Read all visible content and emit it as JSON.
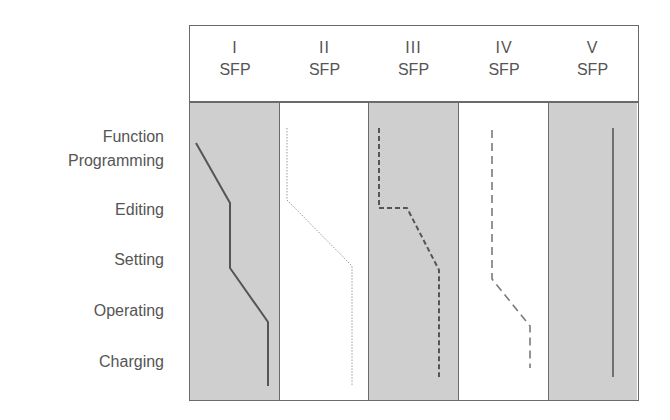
{
  "diagram": {
    "type": "phase-diagram",
    "row_header_label": "Function",
    "rows": [
      {
        "label": "Programming",
        "y": 161
      },
      {
        "label": "Editing",
        "y": 210
      },
      {
        "label": "Setting",
        "y": 260
      },
      {
        "label": "Operating",
        "y": 311
      },
      {
        "label": "Charging",
        "y": 362
      }
    ],
    "columns": [
      {
        "roman": "I",
        "sub": "SFP",
        "shaded": true
      },
      {
        "roman": "II",
        "sub": "SFP",
        "shaded": false
      },
      {
        "roman": "III",
        "sub": "SFP",
        "shaded": true
      },
      {
        "roman": "IV",
        "sub": "SFP",
        "shaded": false
      },
      {
        "roman": "V",
        "sub": "SFP",
        "shaded": true
      }
    ],
    "paths": [
      {
        "column": "I",
        "style": "solid",
        "points": "196,143 230,203 230,268 268,322 268,386"
      },
      {
        "column": "II",
        "style": "dotted",
        "points": "287,128 287,200 352,266 352,386"
      },
      {
        "column": "III",
        "style": "short-dash",
        "points": "379,128 379,208 407,208 439,270 439,377"
      },
      {
        "column": "IV",
        "style": "long-dash",
        "points": "492,130 492,279 530,326 530,368"
      },
      {
        "column": "V",
        "style": "solid",
        "points": "613,128 613,377"
      }
    ],
    "colors": {
      "shaded_fill": "#cfcfcf",
      "border": "#6a6a6a",
      "line": "#555555",
      "text": "#555555"
    }
  }
}
